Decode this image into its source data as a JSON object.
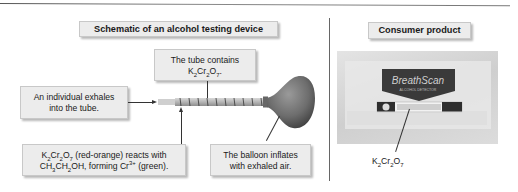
{
  "left_panel": {
    "title": "Schematic of an alcohol testing device",
    "tube_label_line1": "The tube contains",
    "tube_label_formula": {
      "K": "K",
      "k_sub": "2",
      "Cr": "Cr",
      "cr_sub": "2",
      "O": "O",
      "o_sub": "7",
      "suffix": "."
    },
    "exhale_label_line1": "An individual exhales",
    "exhale_label_line2": "into the tube.",
    "reaction_label": {
      "line1_formula_suffix": " (red-orange) reacts with",
      "line2_prefix": "CH",
      "h3": "3",
      "ch2": "CH",
      "h2": "2",
      "oh": "OH, forming Cr",
      "charge": "3+",
      "line2_suffix": " (green)."
    },
    "balloon_label_line1": "The balloon inflates",
    "balloon_label_line2": "with exhaled air."
  },
  "right_panel": {
    "title": "Consumer product",
    "product_brand": "BreathScan",
    "product_subtitle": "ALCOHOL DETECTOR",
    "formula_label": {
      "K": "K",
      "k_sub": "2",
      "Cr": "Cr",
      "cr_sub": "2",
      "O": "O",
      "o_sub": "7"
    }
  },
  "colors": {
    "box_fill": "#ececec",
    "balloon": "#7a7a7a",
    "tube": "#bdbdbd"
  }
}
